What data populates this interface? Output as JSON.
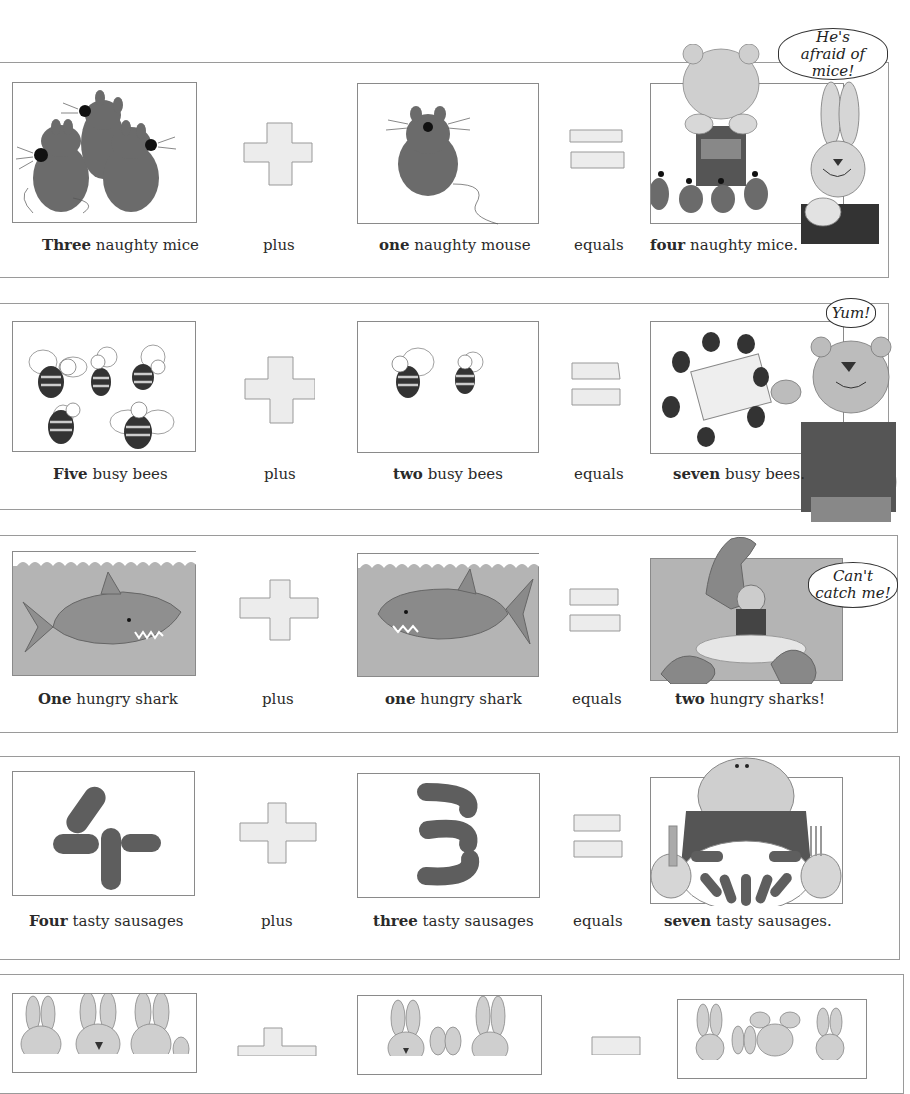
{
  "equations": [
    {
      "id": "mice",
      "term1": {
        "bold": "Three",
        "rest": " naughty mice"
      },
      "operator1": "plus",
      "term2": {
        "bold": "one",
        "rest": " naughty mouse"
      },
      "operator2": "equals",
      "result": {
        "bold": "four",
        "rest": " naughty mice."
      },
      "speech": "He's afraid of mice!",
      "speech_lines": [
        "He's afraid",
        "of mice!"
      ],
      "pictures": [
        "three-mice",
        "one-mouse",
        "four-mice-with-bear-on-chair-and-rabbit"
      ]
    },
    {
      "id": "bees",
      "term1": {
        "bold": "Five",
        "rest": " busy bees"
      },
      "operator1": "plus",
      "term2": {
        "bold": "two",
        "rest": " busy bees"
      },
      "operator2": "equals",
      "result": {
        "bold": "seven",
        "rest": " busy bees."
      },
      "speech": "Yum!",
      "speech_lines": [
        "Yum!"
      ],
      "pictures": [
        "five-bees",
        "two-bees",
        "seven-bees-with-bear"
      ]
    },
    {
      "id": "sharks",
      "term1": {
        "bold": "One",
        "rest": " hungry shark"
      },
      "operator1": "plus",
      "term2": {
        "bold": "one",
        "rest": " hungry shark"
      },
      "operator2": "equals",
      "result": {
        "bold": "two",
        "rest": " hungry sharks!"
      },
      "speech": "Can't catch me!",
      "speech_lines": [
        "Can't",
        "catch me!"
      ],
      "pictures": [
        "one-shark",
        "one-shark",
        "two-sharks-with-bear-on-island"
      ]
    },
    {
      "id": "sausages",
      "term1": {
        "bold": "Four",
        "rest": " tasty sausages"
      },
      "operator1": "plus",
      "term2": {
        "bold": "three",
        "rest": " tasty sausages"
      },
      "operator2": "equals",
      "result": {
        "bold": "seven",
        "rest": " tasty sausages."
      },
      "speech": "",
      "pictures": [
        "four-sausages",
        "three-sausages",
        "seven-sausages-with-crocodile"
      ]
    },
    {
      "id": "rabbits",
      "pictures": [
        "rabbits-group-1",
        "rabbits-group-2",
        "rabbits-group-3"
      ]
    }
  ],
  "colors": {
    "ink": "#2a2a2a",
    "frame": "#8a8a8a",
    "fill_dark": "#6b6b6b",
    "fill_mid": "#a8a8a8",
    "fill_light": "#d6d6d6",
    "sign_fill": "#e6e6e6"
  }
}
